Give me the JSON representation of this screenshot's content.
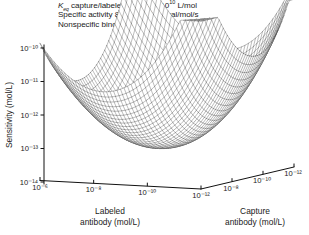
{
  "annotations": {
    "line1_prefix": "K",
    "line1_sub": "eq",
    "line1_mid": " capture/labeled antibody 10",
    "line1_sup": "10",
    "line1_suffix": " L/mol",
    "line2_prefix": "Specific activity 8.02 × 10",
    "line2_sup": "16",
    "line2_suffix": " signal/mol/s",
    "line3": "Nonspecific binding 0.1%"
  },
  "axes": {
    "y": {
      "title": "Sensitivity (mol/L)",
      "ticks": [
        "10⁻¹⁰",
        "10⁻¹¹",
        "10⁻¹²",
        "10⁻¹³",
        "10⁻¹⁴"
      ],
      "exponents": [
        -10,
        -11,
        -12,
        -13,
        -14
      ],
      "min_exp": -14,
      "max_exp": -10
    },
    "x_left": {
      "title_line1": "Labeled",
      "title_line2": "antibody (mol/L)",
      "ticks": [
        "10⁻⁶",
        "10⁻⁸",
        "10⁻¹⁰",
        "10⁻¹²"
      ],
      "exponents": [
        -6,
        -8,
        -10,
        -12
      ]
    },
    "x_right": {
      "title_line1": "Capture",
      "title_line2": "antibody (mol/L)",
      "ticks": [
        "10⁻⁸",
        "10⁻¹⁰",
        "10⁻¹²"
      ],
      "exponents": [
        -8,
        -10,
        -12
      ]
    }
  },
  "colors": {
    "axis": "#111111",
    "mesh": "#3c3c3c",
    "text": "#1a1a1a",
    "background": "#ffffff"
  },
  "chart_data": {
    "type": "surface",
    "title": "",
    "xlabel": "Labeled antibody (mol/L)",
    "ylabel": "Capture antibody (mol/L)",
    "zlabel": "Sensitivity (mol/L)",
    "x_log_range": [
      -6,
      -12
    ],
    "y_log_range": [
      -6,
      -12
    ],
    "z_log_range": [
      -14,
      -10
    ],
    "grid": false,
    "legend": false,
    "x_labeled_exponents": [
      -6,
      -7,
      -8,
      -9,
      -10,
      -11,
      -12
    ],
    "y_capture_exponents": [
      -6,
      -7,
      -8,
      -9,
      -10,
      -11,
      -12
    ],
    "z_sensitivity_log_grid": [
      [
        -10.0,
        -10.4,
        -10.8,
        -11.1,
        -11.2,
        -10.9,
        -10.1
      ],
      [
        -10.4,
        -10.9,
        -11.4,
        -11.8,
        -11.9,
        -11.5,
        -10.6
      ],
      [
        -10.8,
        -11.4,
        -12.0,
        -12.5,
        -12.6,
        -12.1,
        -11.1
      ],
      [
        -11.1,
        -11.8,
        -12.5,
        -13.1,
        -13.2,
        -12.6,
        -11.5
      ],
      [
        -11.2,
        -11.9,
        -12.6,
        -13.2,
        -13.4,
        -12.7,
        -11.6
      ],
      [
        -10.9,
        -11.5,
        -12.1,
        -12.6,
        -12.7,
        -12.2,
        -11.2
      ],
      [
        -10.1,
        -10.6,
        -11.1,
        -11.5,
        -11.6,
        -11.2,
        -10.3
      ]
    ],
    "optimum": {
      "labeled_antibody": "10⁻¹⁰",
      "capture_antibody": "10⁻¹⁰",
      "sensitivity": "10⁻¹³·⁴"
    }
  }
}
